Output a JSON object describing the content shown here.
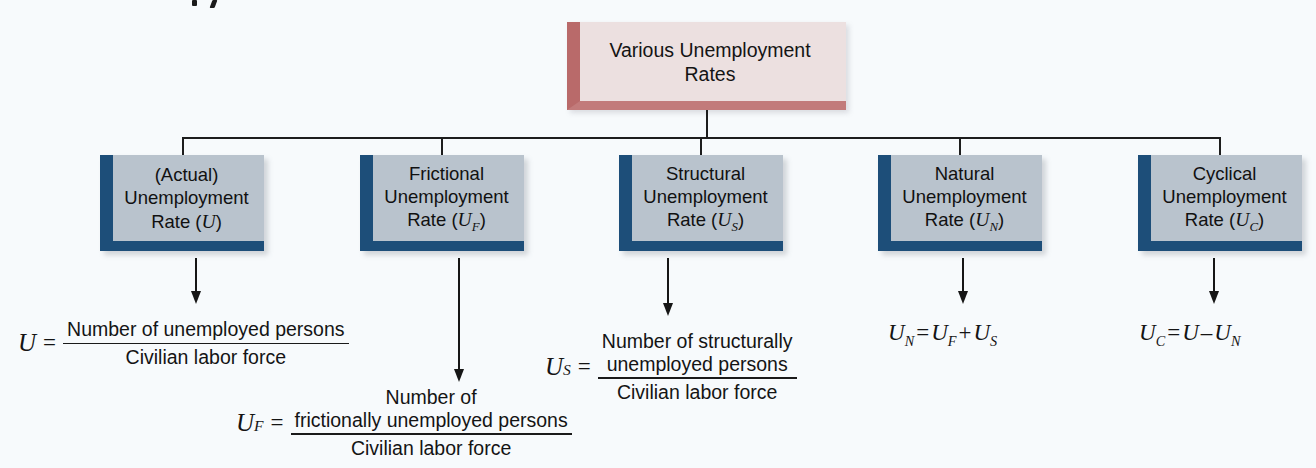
{
  "figure": {
    "type": "hierarchy-diagram",
    "title": "Various Unemployment Rates",
    "background_color": "#f7fafc",
    "root": {
      "label_line1": "Various Unemployment",
      "label_line2": "Rates",
      "fill_color": "#ece0e0",
      "accent_color": "#b96a6a"
    },
    "nodes": [
      {
        "id": "actual",
        "line1": "(Actual)",
        "line2": "Unemployment",
        "line3_prefix": "Rate (",
        "symbol": "U",
        "subscript": "",
        "line3_suffix": ")",
        "fill_color": "#b9c3cd",
        "accent_color": "#1d4e79"
      },
      {
        "id": "frictional",
        "line1": "Frictional",
        "line2": "Unemployment",
        "line3_prefix": "Rate (",
        "symbol": "U",
        "subscript": "F",
        "line3_suffix": ")",
        "fill_color": "#b9c3cd",
        "accent_color": "#1d4e79"
      },
      {
        "id": "structural",
        "line1": "Structural",
        "line2": "Unemployment",
        "line3_prefix": "Rate (",
        "symbol": "U",
        "subscript": "S",
        "line3_suffix": ")",
        "fill_color": "#b9c3cd",
        "accent_color": "#1d4e79"
      },
      {
        "id": "natural",
        "line1": "Natural",
        "line2": "Unemployment",
        "line3_prefix": "Rate (",
        "symbol": "U",
        "subscript": "N",
        "line3_suffix": ")",
        "fill_color": "#b9c3cd",
        "accent_color": "#1d4e79"
      },
      {
        "id": "cyclical",
        "line1": "Cyclical",
        "line2": "Unemployment",
        "line3_prefix": "Rate (",
        "symbol": "U",
        "subscript": "C",
        "line3_suffix": ")",
        "fill_color": "#b9c3cd",
        "accent_color": "#1d4e79"
      }
    ],
    "formulas": [
      {
        "id": "actual-formula",
        "lhs_symbol": "U",
        "lhs_subscript": "",
        "equals": "=",
        "numerator_line1": "Number of unemployed persons",
        "numerator_line2": "",
        "denominator": "Civilian labor force"
      },
      {
        "id": "frictional-formula",
        "lhs_symbol": "U",
        "lhs_subscript": "F",
        "equals": "=",
        "numerator_line1": "Number of",
        "numerator_line2": "frictionally unemployed persons",
        "denominator": "Civilian labor force"
      },
      {
        "id": "structural-formula",
        "lhs_symbol": "U",
        "lhs_subscript": "S",
        "equals": "=",
        "numerator_line1": "Number of structurally",
        "numerator_line2": "unemployed persons",
        "denominator": "Civilian labor force"
      }
    ],
    "identities": [
      {
        "id": "natural-identity",
        "lhs_symbol": "U",
        "lhs_subscript": "N",
        "equals": "=",
        "term1_symbol": "U",
        "term1_subscript": "F",
        "operator": "+",
        "term2_symbol": "U",
        "term2_subscript": "S"
      },
      {
        "id": "cyclical-identity",
        "lhs_symbol": "U",
        "lhs_subscript": "C",
        "equals": "=",
        "term1_symbol": "U",
        "term1_subscript": "",
        "operator": "–",
        "term2_symbol": "U",
        "term2_subscript": "N"
      }
    ]
  }
}
